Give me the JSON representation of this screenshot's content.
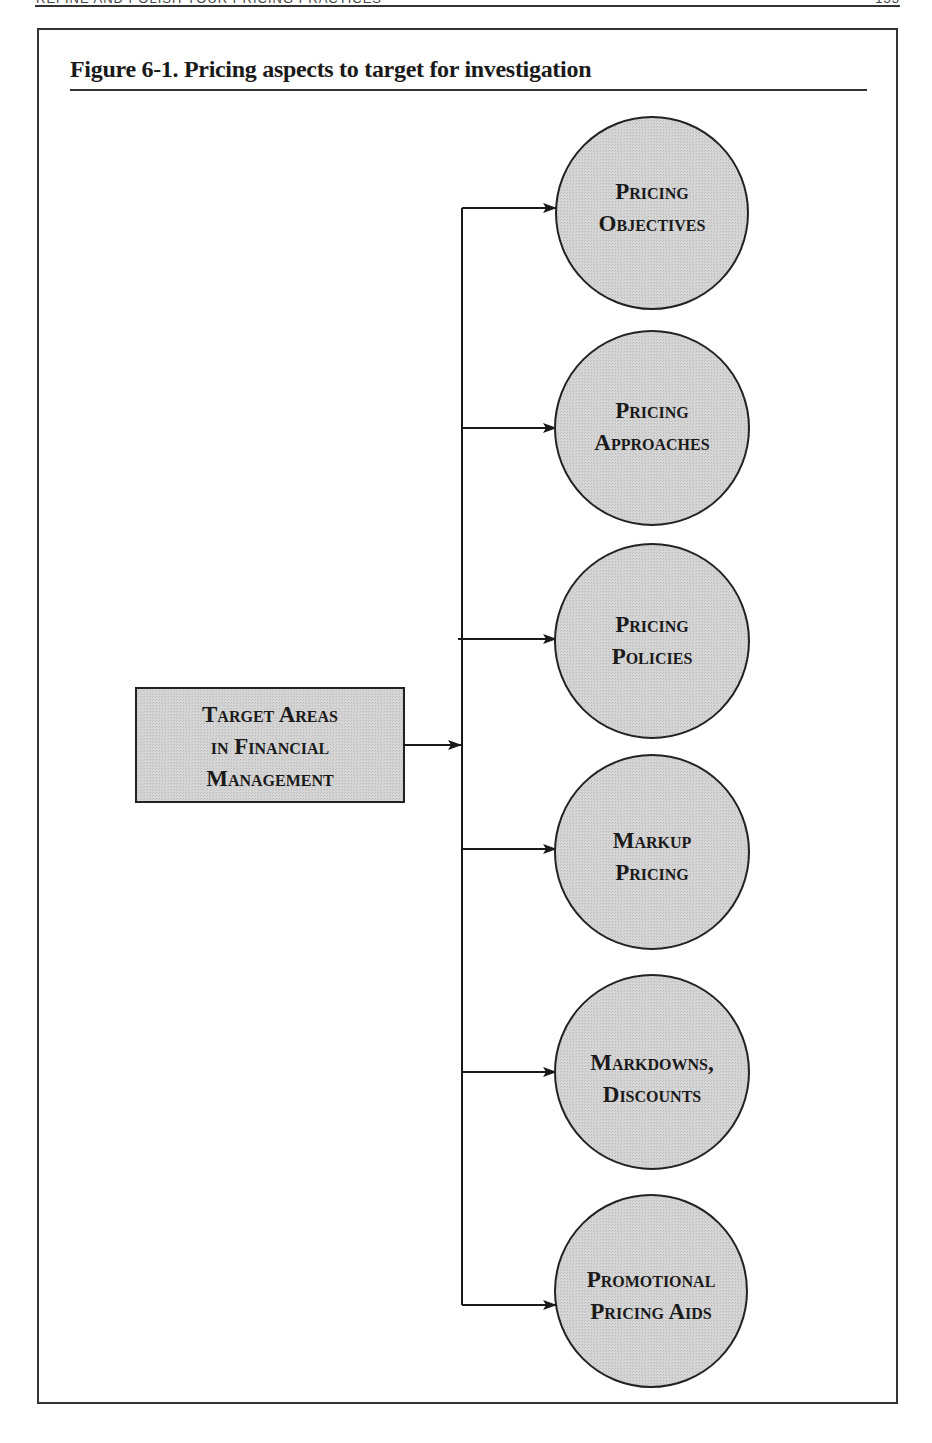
{
  "running_header": {
    "title": "REFINE AND POLISH YOUR PRICING PRACTICES",
    "page": "133"
  },
  "figure": {
    "title": "Figure 6-1.  Pricing aspects to target for investigation"
  },
  "diagram": {
    "source": {
      "lines": [
        "Target Areas",
        "in Financial",
        "Management"
      ]
    },
    "targets": [
      {
        "lines": [
          "Pricing",
          "Objectives"
        ]
      },
      {
        "lines": [
          "Pricing",
          "Approaches"
        ]
      },
      {
        "lines": [
          "Pricing",
          "Policies"
        ]
      },
      {
        "lines": [
          "Markup",
          "Pricing"
        ]
      },
      {
        "lines": [
          "Markdowns,",
          "Discounts"
        ]
      },
      {
        "lines": [
          "Promotional",
          "Pricing Aids"
        ]
      }
    ],
    "colors": {
      "fill": "#d4d4d4",
      "stroke": "#222222"
    }
  }
}
